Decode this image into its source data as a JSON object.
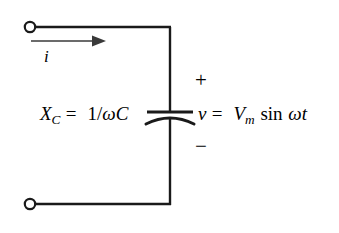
{
  "figure": {
    "type": "circuit-diagram",
    "background_color": "#ffffff",
    "stroke_color": "#1a1a1a"
  },
  "labels": {
    "current": "i",
    "polarity_plus": "+",
    "polarity_minus": "−"
  },
  "reactance": {
    "symbol": "X",
    "subscript": "C",
    "equals": "=",
    "numerator": "1/",
    "omega": "ω",
    "capacitance": "C"
  },
  "voltage": {
    "symbol": "v",
    "equals": "=",
    "amplitude": "V",
    "subscript": "m",
    "function": "sin",
    "omega": "ω",
    "time": "t"
  },
  "components": {
    "capacitor": "capacitor-curved-plate",
    "terminal_top": "open-terminal",
    "terminal_bottom": "open-terminal",
    "current_arrow": "arrow-right"
  }
}
